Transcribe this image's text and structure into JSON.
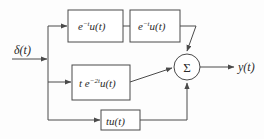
{
  "diagram": {
    "input": {
      "label_delta": "δ",
      "label_paren_t": "(t)",
      "name": "impulse-input"
    },
    "output": {
      "label_y": "y",
      "label_paren_t": "(t)",
      "name": "system-output"
    },
    "summing_node": {
      "symbol": "Σ"
    },
    "blocks": [
      {
        "id": "block-exp-1",
        "base": "e",
        "exponent": "−t",
        "tail": "u(t)",
        "full_text": "e^(-t)u(t)",
        "x": 68,
        "y": 10,
        "w": 55,
        "h": 32
      },
      {
        "id": "block-exp-2",
        "base": "e",
        "exponent": "−t",
        "tail": "u(t)",
        "full_text": "e^(-t)u(t)",
        "x": 130,
        "y": 10,
        "w": 50,
        "h": 32
      },
      {
        "id": "block-t-exp-2t",
        "prefix": "t e",
        "exponent": "−2t",
        "tail": "u(t)",
        "full_text": "t e^(-2t)u(t)",
        "x": 72,
        "y": 65,
        "w": 58,
        "h": 35
      },
      {
        "id": "block-tu",
        "base": "tu",
        "exponent": "",
        "tail": "(t)",
        "full_text": "tu(t)",
        "x": 101,
        "y": 110,
        "w": 39,
        "h": 20
      }
    ],
    "colors": {
      "stroke": "#4a4a4a",
      "text": "#2b2b2b",
      "background": "#fdfdfd",
      "block_fill": "#ffffff"
    }
  }
}
